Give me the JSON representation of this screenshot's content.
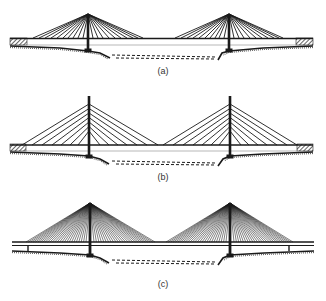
{
  "figure": {
    "panels": [
      {
        "label": "(a)",
        "cable_arrangement": "fan",
        "cables_per_side": 10
      },
      {
        "label": "(b)",
        "cable_arrangement": "semi-harp",
        "cables_per_side": 7
      },
      {
        "label": "(c)",
        "cable_arrangement": "multi-cable fan",
        "cables_per_side": 26
      }
    ]
  },
  "colors": {
    "line": "#1a1a1a",
    "background": "#ffffff"
  }
}
